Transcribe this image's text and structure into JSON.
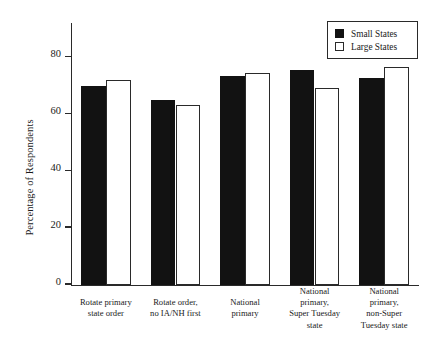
{
  "chart_data": {
    "type": "bar",
    "title": "",
    "xlabel": "",
    "ylabel": "Percentage of Respondents",
    "ylim": [
      0,
      92
    ],
    "yticks": [
      0,
      20,
      40,
      60,
      80
    ],
    "ytick_labels": [
      "0",
      "20",
      "40",
      "60",
      "80"
    ],
    "grid": false,
    "legend_position": "top-right",
    "categories": [
      "Rotate primary\nstate order",
      "Rotate order,\nno IA/NH first",
      "National\nprimary",
      "National\nprimary,\nSuper Tuesday\nstate",
      "National\nprimary,\nnon-Super\nTuesday state"
    ],
    "series": [
      {
        "name": "Small States",
        "color": "#121212",
        "values": [
          70.0,
          65.0,
          73.5,
          75.5,
          72.5
        ]
      },
      {
        "name": "Large States",
        "color": "#ffffff",
        "values": [
          72.0,
          63.0,
          74.5,
          69.0,
          76.5
        ]
      }
    ]
  },
  "legend": {
    "items": [
      {
        "label": "Small States",
        "swatch": "filled-square-icon"
      },
      {
        "label": "Large States",
        "swatch": "outlined-square-icon"
      }
    ]
  }
}
